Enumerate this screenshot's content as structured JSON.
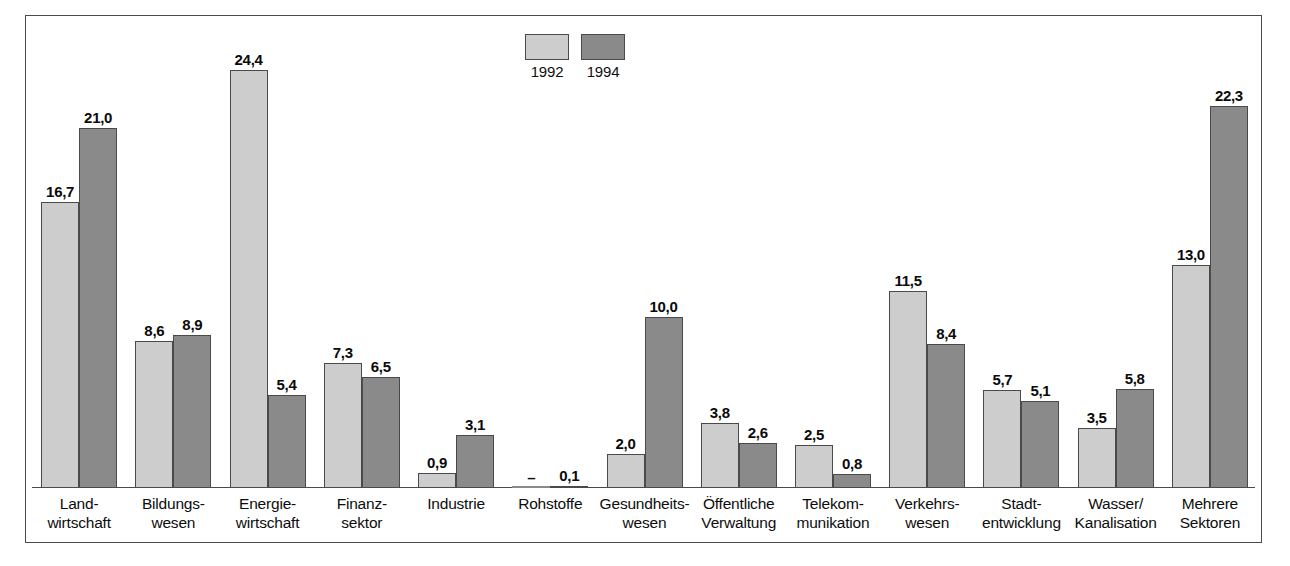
{
  "chart_data": {
    "type": "bar",
    "title": "",
    "subtitle": "",
    "xlabel": "",
    "ylabel": "",
    "ylim": [
      0,
      26
    ],
    "grid": false,
    "legend_position": "top-center",
    "value_format": "comma-decimal",
    "categories": [
      "Land-\nwirtschaft",
      "Bildungs-\nwesen",
      "Energie-\nwirtschaft",
      "Finanz-\nsektor",
      "Industrie",
      "Rohstoffe",
      "Gesundheits-\nwesen",
      "Öffentliche\nVerwaltung",
      "Telekom-\nmunikation",
      "Verkehrs-\nwesen",
      "Stadt-\nentwicklung",
      "Wasser/\nKanalisation",
      "Mehrere\nSektoren"
    ],
    "series": [
      {
        "name": "1992",
        "color": "#cdcdcd",
        "values": [
          16.7,
          8.6,
          24.4,
          7.3,
          0.9,
          null,
          2.0,
          3.8,
          2.5,
          11.5,
          5.7,
          3.5,
          13.0
        ],
        "labels": [
          "16,7",
          "8,6",
          "24,4",
          "7,3",
          "0,9",
          "–",
          "2,0",
          "3,8",
          "2,5",
          "11,5",
          "5,7",
          "3,5",
          "13,0"
        ]
      },
      {
        "name": "1994",
        "color": "#8a8a8a",
        "values": [
          21.0,
          8.9,
          5.4,
          6.5,
          3.1,
          0.1,
          10.0,
          2.6,
          0.8,
          8.4,
          5.1,
          5.8,
          22.3
        ],
        "labels": [
          "21,0",
          "8,9",
          "5,4",
          "6,5",
          "3,1",
          "0,1",
          "10,0",
          "2,6",
          "0,8",
          "8,4",
          "5,1",
          "5,8",
          "22,3"
        ]
      }
    ]
  },
  "legend": {
    "items": [
      {
        "label": "1992",
        "color": "#cdcdcd"
      },
      {
        "label": "1994",
        "color": "#8a8a8a"
      }
    ]
  },
  "colors": {
    "series_1992": "#cdcdcd",
    "series_1994": "#8a8a8a",
    "border": "#4a4a4a",
    "background": "#ffffff",
    "text": "#0d0d0d"
  }
}
